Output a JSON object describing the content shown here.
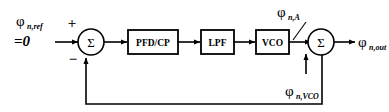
{
  "diagram": {
    "type": "control-block-diagram",
    "stroke_color": "#000000",
    "background_color": "#ffffff",
    "blocks": [
      {
        "id": "pfd_cp",
        "label": "PFD/CP"
      },
      {
        "id": "lpf",
        "label": "LPF"
      },
      {
        "id": "vco",
        "label": "VCO"
      }
    ],
    "summers": [
      {
        "id": "input-summer",
        "symbol": "Σ",
        "plus_sign": "+",
        "minus_sign": "−"
      },
      {
        "id": "output-summer",
        "symbol": "Σ"
      }
    ],
    "labels": {
      "input_signal": {
        "phi": "φ",
        "subscript": "n,ref",
        "value": "=0"
      },
      "vco_amp_noise": {
        "phi": "φ",
        "subscript": "n,A"
      },
      "vco_noise": {
        "phi": "φ",
        "subscript": "n,VCO"
      },
      "output_signal": {
        "phi": "φ",
        "subscript": "n,out"
      }
    },
    "paths": {
      "feedback_loop": "output node down, left, up into minus input",
      "forward_chain": "input summer -> PFD/CP -> LPF -> VCO -> output summer -> output"
    }
  }
}
